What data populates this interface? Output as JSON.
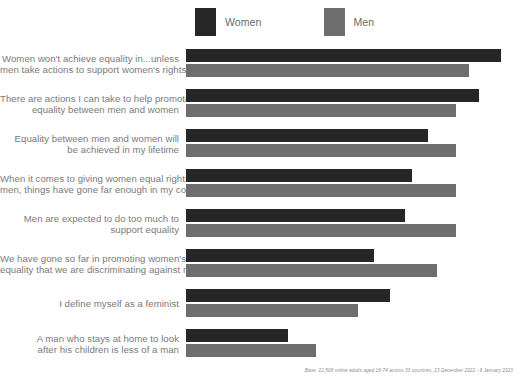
{
  "legend": {
    "position": "top-left",
    "items": [
      {
        "label": "Women",
        "color": "#262626",
        "swatch_name": "legend-swatch-women"
      },
      {
        "label": "Men",
        "color": "#6e6e6e",
        "swatch_name": "legend-swatch-men"
      }
    ]
  },
  "footnote": "Base: 22,508 online adults aged 16-74 across 33 countries, 23 December 2022 - 6 January 2023",
  "chart_data": {
    "type": "bar",
    "orientation": "horizontal",
    "title": "",
    "subtitle": "",
    "xlabel": "",
    "ylabel": "",
    "xlim": [
      0,
      100
    ],
    "grid": false,
    "legend_position": "top-left",
    "categories": [
      "Women won't achieve equality in...unless men take actions to support women's rights too",
      "There are actions I can take to help promote equality between men and women",
      "Equality between men and women will be achieved in my lifetime",
      "When it comes to giving women equal rights with men, things have gone far enough in my country",
      "Men are expected to do too much to support equality",
      "We have gone so far in promoting women's equality that we are discriminating against men",
      "I define myself as a feminist",
      "A man who stays at home to look after his children is less of a man"
    ],
    "category_lines": [
      [
        "Women won't achieve equality in...unless",
        "men take actions to support women's rights too"
      ],
      [
        "There are actions I can take to help promote",
        "equality between men and women"
      ],
      [
        "Equality between men and women will",
        "be achieved in my lifetime"
      ],
      [
        "When it comes to giving women equal rights with",
        "men, things have gone far enough in my country"
      ],
      [
        "Men are expected to do too much to",
        "support equality"
      ],
      [
        "We have gone so far in promoting women's",
        "equality that we are discriminating against men"
      ],
      [
        "I define myself as a feminist",
        ""
      ],
      [
        "A man who stays at home to look",
        "after his children is less of a man"
      ]
    ],
    "series": [
      {
        "name": "Women",
        "color": "#262626",
        "values": [
          99,
          92,
          76,
          71,
          69,
          59,
          64,
          32
        ]
      },
      {
        "name": "Men",
        "color": "#6e6e6e",
        "values": [
          89,
          85,
          85,
          85,
          85,
          79,
          54,
          41
        ]
      }
    ]
  }
}
